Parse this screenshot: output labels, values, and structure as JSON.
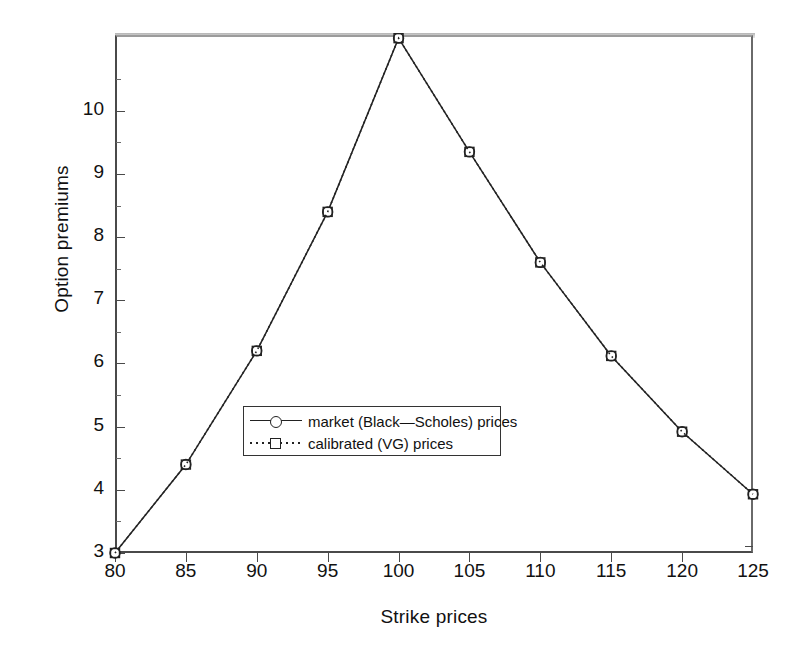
{
  "chart_data": {
    "type": "line",
    "title": "",
    "xlabel": "Strike prices",
    "ylabel": "Option premiums",
    "x": [
      80,
      85,
      90,
      95,
      100,
      105,
      110,
      115,
      120,
      125
    ],
    "xlim": [
      80,
      125
    ],
    "ylim": [
      3,
      11.2
    ],
    "yticks": [
      3,
      4,
      5,
      6,
      7,
      8,
      9,
      10
    ],
    "xticks": [
      80,
      85,
      90,
      95,
      100,
      105,
      110,
      115,
      120,
      125
    ],
    "grid": false,
    "legend_position": "center",
    "series": [
      {
        "name": "market (Black—Scholes) prices",
        "marker": "circle",
        "linestyle": "solid",
        "color": "#222222",
        "values": [
          3.0,
          4.4,
          6.2,
          8.4,
          11.15,
          9.35,
          7.6,
          6.12,
          4.92,
          3.93
        ]
      },
      {
        "name": "calibrated (VG) prices",
        "marker": "square",
        "linestyle": "dotted",
        "color": "#222222",
        "values": [
          3.0,
          4.4,
          6.2,
          8.4,
          11.15,
          9.35,
          7.6,
          6.12,
          4.92,
          3.93
        ]
      }
    ]
  },
  "axes": {
    "xtick_labels": [
      "80",
      "85",
      "90",
      "95",
      "100",
      "105",
      "110",
      "115",
      "120",
      "125"
    ],
    "ytick_labels": [
      "3",
      "4",
      "5",
      "6",
      "7",
      "8",
      "9",
      "10"
    ],
    "xlabel": "Strike prices",
    "ylabel": "Option premiums"
  },
  "legend": {
    "entries": [
      {
        "label": "market (Black—Scholes) prices",
        "marker": "circle-icon",
        "line": "solid-line-icon"
      },
      {
        "label": "calibrated (VG) prices",
        "marker": "square-icon",
        "line": "dotted-line-icon"
      }
    ]
  },
  "colors": {
    "line": "#222222",
    "axis": "#4a4a4a",
    "background": "#ffffff"
  }
}
